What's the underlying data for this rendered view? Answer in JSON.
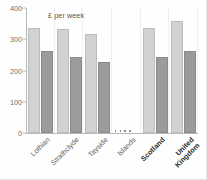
{
  "chart_data": {
    "type": "bar",
    "title": "",
    "subtitle": "",
    "annotation": "£ per week",
    "xlabel": "",
    "ylabel": "",
    "ylim": [
      0,
      400
    ],
    "yticks": [
      0,
      100,
      200,
      300,
      400
    ],
    "ytick_labels": [
      "0",
      "100",
      "200",
      "300",
      "400"
    ],
    "grid": "vertical-faint",
    "legend": "none",
    "categories": [
      "Lothian",
      "Strathclyde",
      "Tayside",
      "Islands",
      "Scotland",
      "United Kingdom"
    ],
    "category_lines": [
      [
        "Lothian"
      ],
      [
        "Strathclyde"
      ],
      [
        "Tayside"
      ],
      [
        "Islands"
      ],
      [
        "Scotland"
      ],
      [
        "United",
        "Kingdom"
      ]
    ],
    "category_emphasis": [
      false,
      false,
      false,
      false,
      true,
      true
    ],
    "no_data_categories": [
      "Islands"
    ],
    "no_data_marker": "....",
    "series": [
      {
        "name": "series-1",
        "color": "#d2d2d2",
        "values": [
          336,
          332,
          318,
          null,
          336,
          360
        ]
      },
      {
        "name": "series-2",
        "color": "#9b9b9b",
        "values": [
          262,
          244,
          226,
          null,
          244,
          262
        ]
      }
    ]
  },
  "colors": {
    "series_light": "#d2d2d2",
    "series_dark": "#9b9b9b",
    "axis": "#b9b9b9",
    "grid": "#f0f0f0",
    "tick_text": "#6e6e6e",
    "label_text": "#5d5d5d",
    "label_text_bold": "#2e2e2e",
    "background": "#fefefe"
  }
}
